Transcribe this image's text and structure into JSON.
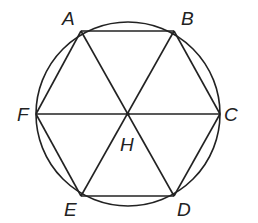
{
  "diagram": {
    "circle": {
      "cx": 128,
      "cy": 114,
      "r": 92
    },
    "center": {
      "label": "H",
      "x": 128,
      "y": 114
    },
    "vertices": [
      {
        "label": "A",
        "x": 81,
        "y": 31
      },
      {
        "label": "B",
        "x": 174,
        "y": 31
      },
      {
        "label": "C",
        "x": 220,
        "y": 114
      },
      {
        "label": "D",
        "x": 174,
        "y": 196
      },
      {
        "label": "E",
        "x": 81,
        "y": 196
      },
      {
        "label": "F",
        "x": 36,
        "y": 114
      }
    ],
    "labels": {
      "A": "A",
      "B": "B",
      "C": "C",
      "D": "D",
      "E": "E",
      "F": "F",
      "H": "H"
    },
    "segments": [
      [
        "A",
        "B"
      ],
      [
        "B",
        "C"
      ],
      [
        "C",
        "D"
      ],
      [
        "D",
        "E"
      ],
      [
        "E",
        "F"
      ],
      [
        "F",
        "A"
      ],
      [
        "A",
        "D"
      ],
      [
        "B",
        "E"
      ],
      [
        "C",
        "F"
      ]
    ],
    "stroke_color": "#222222"
  }
}
